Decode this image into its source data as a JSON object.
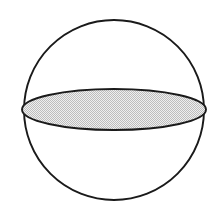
{
  "figure": {
    "title": "Sphere with shaded equatorial cross-section",
    "caption": "",
    "background_color": "#ffffff",
    "width": 220,
    "height": 222
  },
  "colors": {
    "stroke": "#1a1a1a",
    "fill_light": "#d8d8d8",
    "dither_dot": "#9a9a9a",
    "background": "#ffffff"
  },
  "shapes": {
    "sphere_outline": {
      "name": "sphere-outline",
      "type": "circle",
      "center_x": 114,
      "center_y": 110,
      "radius": 90,
      "stroke_width": 1.9,
      "fill": "none"
    },
    "great_circle": {
      "name": "great-circle-ellipse",
      "type": "ellipse",
      "center_x": 114,
      "center_y": 109.5,
      "radius_x": 92,
      "radius_y": 20.5,
      "stroke_width": 1.9,
      "fill": "dither-pattern"
    }
  },
  "labels": {
    "sphere": "",
    "cross_section": ""
  }
}
